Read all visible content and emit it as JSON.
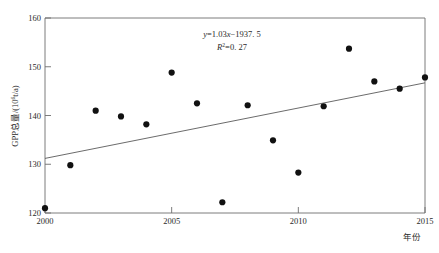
{
  "chart_data": {
    "type": "scatter",
    "title": "",
    "xlabel": "年份",
    "ylabel": "GPP总量/(10⁶t/a)",
    "xlim": [
      2000,
      2015
    ],
    "ylim": [
      120,
      160
    ],
    "xticks": [
      2000,
      2005,
      2010,
      2015
    ],
    "xtick_labels": [
      "2000",
      "2005",
      "2010",
      "2015"
    ],
    "yticks": [
      120,
      130,
      140,
      150,
      160
    ],
    "ytick_labels": [
      "120",
      "130",
      "140",
      "150",
      "160"
    ],
    "grid": false,
    "legend": "none",
    "x": [
      2000,
      2001,
      2002,
      2003,
      2004,
      2005,
      2006,
      2007,
      2008,
      2009,
      2010,
      2011,
      2012,
      2013,
      2014,
      2015
    ],
    "values": [
      121.0,
      129.8,
      141.0,
      139.8,
      138.2,
      148.8,
      142.5,
      122.2,
      142.1,
      134.9,
      128.3,
      141.9,
      153.7,
      147.0,
      145.5,
      147.8
    ],
    "series": [
      {
        "name": "GPP总量",
        "marker": "filled-circle",
        "color": "#111111",
        "values": [
          121.0,
          129.8,
          141.0,
          139.8,
          138.2,
          148.8,
          142.5,
          122.2,
          142.1,
          134.9,
          128.3,
          141.9,
          153.7,
          147.0,
          145.5,
          147.8
        ]
      }
    ],
    "trendline": {
      "type": "linear",
      "slope": 1.03,
      "intercept": -1937.5,
      "x_start": 2000,
      "x_end": 2015,
      "y_start": 131.2,
      "y_end": 146.7,
      "color": "#5a5a5a"
    },
    "annotations": {
      "equation": "y=1.03x−1937.5",
      "equation_parts": {
        "y": "y",
        "eq": "=1.",
        "slope_digits": "03",
        "x": "x",
        "rest": "−1937. 5"
      },
      "r_squared_label": "R",
      "r_squared_sup": "2",
      "r_squared_value": "=0. 27"
    }
  },
  "axis": {
    "x_title": "年份",
    "y_title_main": "GPP总量/(10",
    "y_title_sup": "6",
    "y_title_tail": "t/a)"
  }
}
